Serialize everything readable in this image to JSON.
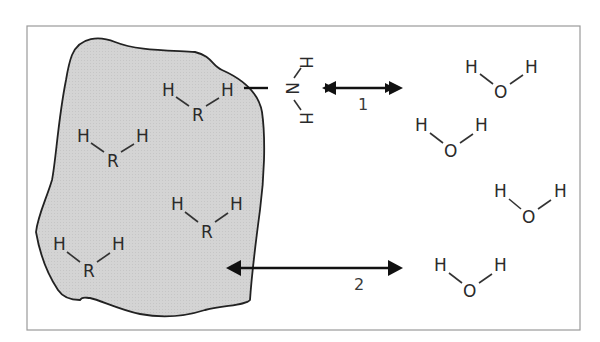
{
  "figure": {
    "colors": {
      "surface_fill": "#d6d6d6",
      "frame": "#999999",
      "ink": "#222222"
    }
  },
  "surface": {
    "molecules": [
      {
        "left_h": "H",
        "center": "R",
        "right_h": "H"
      },
      {
        "left_h": "H",
        "center": "R",
        "right_h": "H"
      },
      {
        "left_h": "H",
        "center": "R",
        "right_h": "H"
      },
      {
        "left_h": "H",
        "center": "R",
        "right_h": "H"
      }
    ]
  },
  "ammonia": {
    "n": "N",
    "h_top": "H",
    "h_bottom": "H"
  },
  "arrows": [
    {
      "label": "1"
    },
    {
      "label": "2"
    }
  ],
  "water": {
    "molecules": [
      {
        "left_h": "H",
        "center": "O",
        "right_h": "H"
      },
      {
        "left_h": "H",
        "center": "O",
        "right_h": "H"
      },
      {
        "left_h": "H",
        "center": "O",
        "right_h": "H"
      },
      {
        "left_h": "H",
        "center": "O",
        "right_h": "H"
      }
    ]
  }
}
